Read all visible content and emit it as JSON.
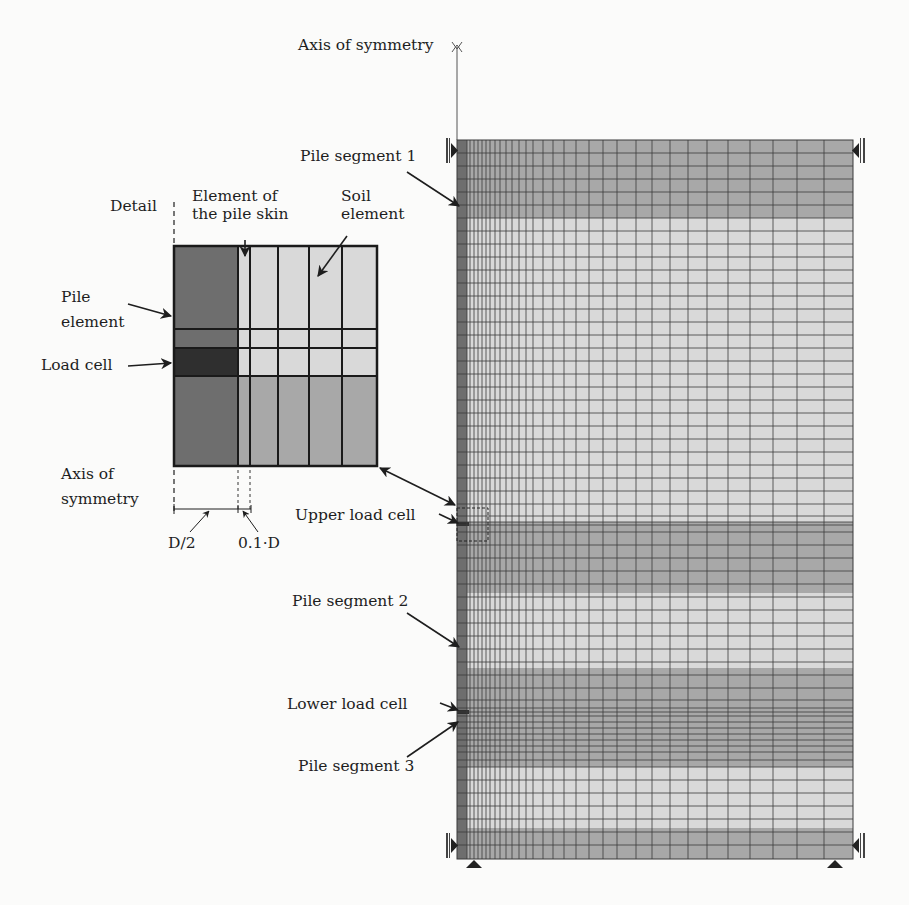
{
  "figure": {
    "labels": {
      "axis_top": "Axis of symmetry",
      "pile_segment_1": "Pile segment 1",
      "detail": "Detail",
      "pile_skin_line1": "Element of",
      "pile_skin_line2": "the pile skin",
      "soil_line1": "Soil",
      "soil_line2": "element",
      "pile_element_line1": "Pile",
      "pile_element_line2": "element",
      "load_cell": "Load cell",
      "axis_bottom_line1": "Axis of",
      "axis_bottom_line2": "symmetry",
      "d_half": "D/2",
      "d_tenth": "0.1·D",
      "upper_load_cell": "Upper load cell",
      "pile_segment_2": "Pile segment 2",
      "lower_load_cell": "Lower load cell",
      "pile_segment_3": "Pile segment 3"
    },
    "colors": {
      "pile": "#6e6e6e",
      "load_cell": "#2f2f2f",
      "soil_dark": "#a8a8a8",
      "soil_light": "#d9d9d9",
      "grid_line": "#3a3a3a",
      "outline": "#1a1a1a"
    },
    "mesh": {
      "x_left": 457,
      "x_right": 853,
      "y_top": 140,
      "y_bottom": 859,
      "pile_strip_width": 10,
      "column_lines": [
        467,
        470,
        474,
        478,
        482,
        486,
        490,
        495,
        500,
        506,
        512,
        519,
        526,
        533,
        543,
        553,
        564,
        576,
        589,
        603,
        617,
        636,
        652,
        670,
        688,
        707,
        728,
        750,
        773,
        797,
        824
      ],
      "bands": [
        {
          "y0": 140,
          "y1": 218,
          "shade": "dark"
        },
        {
          "y0": 218,
          "y1": 522,
          "shade": "light"
        },
        {
          "y0": 522,
          "y1": 593,
          "shade": "dark"
        },
        {
          "y0": 593,
          "y1": 668,
          "shade": "light"
        },
        {
          "y0": 668,
          "y1": 767,
          "shade": "dark"
        },
        {
          "y0": 767,
          "y1": 828,
          "shade": "light"
        },
        {
          "y0": 828,
          "y1": 859,
          "shade": "dark"
        }
      ],
      "row_lines": [
        153,
        166,
        179,
        192,
        205,
        218,
        231,
        244,
        257,
        270,
        283,
        296,
        309,
        322,
        335,
        348,
        361,
        374,
        387,
        400,
        413,
        426,
        439,
        452,
        465,
        478,
        491,
        504,
        516,
        522,
        525,
        532,
        545,
        558,
        571,
        584,
        597,
        610,
        623,
        636,
        649,
        662,
        675,
        688,
        700,
        708,
        712,
        716,
        722,
        728,
        734,
        740,
        746,
        752,
        760,
        767,
        780,
        793,
        806,
        819,
        832,
        845
      ],
      "load_cells": [
        {
          "y": 522,
          "h": 4
        },
        {
          "y": 710,
          "h": 4
        }
      ],
      "upper_load_cell_box": {
        "x": 457,
        "y": 508,
        "w": 31,
        "h": 33
      }
    },
    "detail_box": {
      "x": 174,
      "y": 246,
      "w": 203,
      "h": 220,
      "col_lines": [
        238,
        250,
        278,
        309,
        342
      ],
      "row_lines": [
        329,
        348,
        376
      ]
    }
  }
}
